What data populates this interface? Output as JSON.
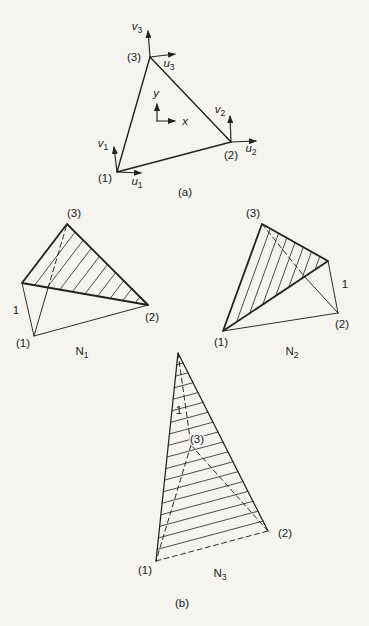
{
  "part_a": {
    "caption": "(a)",
    "axis": {
      "x": "x",
      "y": "y"
    },
    "nodes": {
      "n1": {
        "label": "(1)",
        "u": {
          "base": "u",
          "sub": "1"
        },
        "v": {
          "base": "v",
          "sub": "1"
        }
      },
      "n2": {
        "label": "(2)",
        "u": {
          "base": "u",
          "sub": "2"
        },
        "v": {
          "base": "v",
          "sub": "2"
        }
      },
      "n3": {
        "label": "(3)",
        "u": {
          "base": "u",
          "sub": "3"
        },
        "v": {
          "base": "v",
          "sub": "3"
        }
      }
    }
  },
  "part_b": {
    "caption": "(b)",
    "n1": {
      "name": {
        "base": "N",
        "sub": "1"
      },
      "unit": "1",
      "node1": "(1)",
      "node2": "(2)",
      "node3": "(3)"
    },
    "n2": {
      "name": {
        "base": "N",
        "sub": "2"
      },
      "unit": "1",
      "node1": "(1)",
      "node2": "(2)",
      "node3": "(3)"
    },
    "n3": {
      "name": {
        "base": "N",
        "sub": "3"
      },
      "unit": "1",
      "node1": "(1)",
      "node2": "(2)",
      "node3": "(3)"
    }
  }
}
